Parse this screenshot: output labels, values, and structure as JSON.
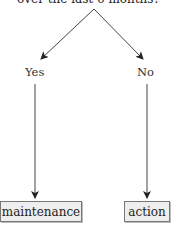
{
  "diagram": {
    "question": "over the last 6 months?",
    "branches": [
      {
        "label": "Yes",
        "outcome": "maintenance"
      },
      {
        "label": "No",
        "outcome": "action"
      }
    ]
  }
}
